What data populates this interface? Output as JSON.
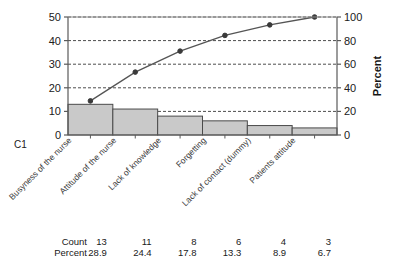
{
  "chart_data": {
    "type": "bar",
    "title": "",
    "xlabel": "",
    "ylabel": "",
    "categories": [
      "Busyness of the nurse",
      "Attitude of the nurse",
      "Lack of knowledge",
      "Forgetting",
      "Lack of contact (dummy)",
      "Patients attitude"
    ],
    "values": [
      13,
      11,
      8,
      6,
      4,
      3
    ],
    "percents": [
      28.9,
      24.4,
      17.8,
      13.3,
      8.9,
      6.7
    ],
    "cumulative_percents": [
      28.9,
      53.3,
      71.1,
      84.4,
      93.3,
      100.0
    ],
    "ylim": [
      0,
      50
    ],
    "yticks": [
      0,
      10,
      20,
      30,
      40,
      50
    ],
    "ylim_right": [
      0,
      100
    ],
    "yticks_right": [
      0,
      20,
      40,
      60,
      80,
      100
    ],
    "ylabel_right": "Percent",
    "grid": true,
    "legend": "none",
    "colors": {
      "bar_fill": "#c9c9c9",
      "bar_stroke": "#4a4a4a",
      "line": "#555555",
      "marker": "#3a3a3a",
      "grid": "#4d4d4d",
      "axis": "#5a5a5a"
    }
  },
  "axes": {
    "group_label": "C1"
  },
  "table": {
    "rows": [
      {
        "label": "Count",
        "values": [
          "13",
          "11",
          "8",
          "6",
          "4",
          "3"
        ]
      },
      {
        "label": "Percent",
        "values": [
          "28.9",
          "24.4",
          "17.8",
          "13.3",
          "8.9",
          "6.7"
        ]
      }
    ]
  }
}
